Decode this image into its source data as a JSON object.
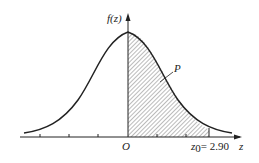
{
  "figure": {
    "type": "standard normal density with shaded right-of-origin area",
    "y_axis_label": "f(z)",
    "x_axis_label": "z",
    "origin_label": "O",
    "region_label": "P",
    "z0_label": "z",
    "z0_subscript": "0",
    "z0_value": "= 2.90",
    "colors": {
      "line": "#222222",
      "hatch": "#555555",
      "background": "#ffffff"
    }
  }
}
